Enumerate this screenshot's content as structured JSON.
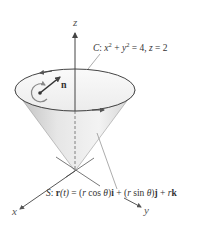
{
  "figure": {
    "colors": {
      "cone_fill_light": "#f2f2f2",
      "cone_fill_dark": "#c8c8c8",
      "rim_fill": "#f4f4f4",
      "line": "#444444",
      "leader": "#777777",
      "orientation_arrow": "#888888"
    },
    "axes": {
      "x_label": "x",
      "y_label": "y",
      "z_label": "z"
    },
    "normal_vector": {
      "label": "n"
    },
    "curve_label": {
      "name": "C",
      "sep": ": ",
      "x": "x",
      "sq1": "2",
      "plus": " + ",
      "y": "y",
      "sq2": "2",
      "eq_rhs": " = 4, ",
      "z": "z",
      "z_rhs": " = 2"
    },
    "surface_label": {
      "name": "S",
      "sep": ": ",
      "r": "r",
      "paren_t": "(t)",
      "equals": " = (",
      "r1": "r",
      "cos": " cos ",
      "theta1": "θ",
      "close1": ")",
      "i": "i",
      "plus1": " + (",
      "r2": "r",
      "sin": " sin ",
      "theta2": "θ",
      "close2": ")",
      "j": "j",
      "plus2": " + ",
      "r3": "r",
      "k": "k"
    }
  }
}
